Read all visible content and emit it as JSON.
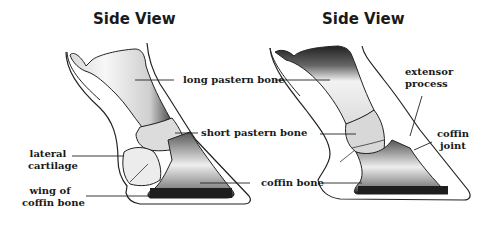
{
  "diagram": {
    "colors": {
      "ink": "#1a1a1a",
      "outline": "#222222",
      "bone_dark": "#2b2b2b",
      "bone_mid": "#8a8a8a",
      "bone_light": "#e8e8e8",
      "background": "#ffffff"
    },
    "left_panel": {
      "title": "Side View",
      "labels": {
        "long_pastern": "long pastern bone",
        "short_pastern": "short pastern bone",
        "coffin_bone": "coffin bone",
        "lateral_cartilage_1": "lateral",
        "lateral_cartilage_2": "cartilage",
        "wing_1": "wing of",
        "wing_2": "coffin bone"
      }
    },
    "right_panel": {
      "title": "Side View",
      "labels": {
        "extensor_1": "extensor",
        "extensor_2": "process",
        "coffin_joint_1": "coffin",
        "coffin_joint_2": "joint"
      }
    }
  }
}
